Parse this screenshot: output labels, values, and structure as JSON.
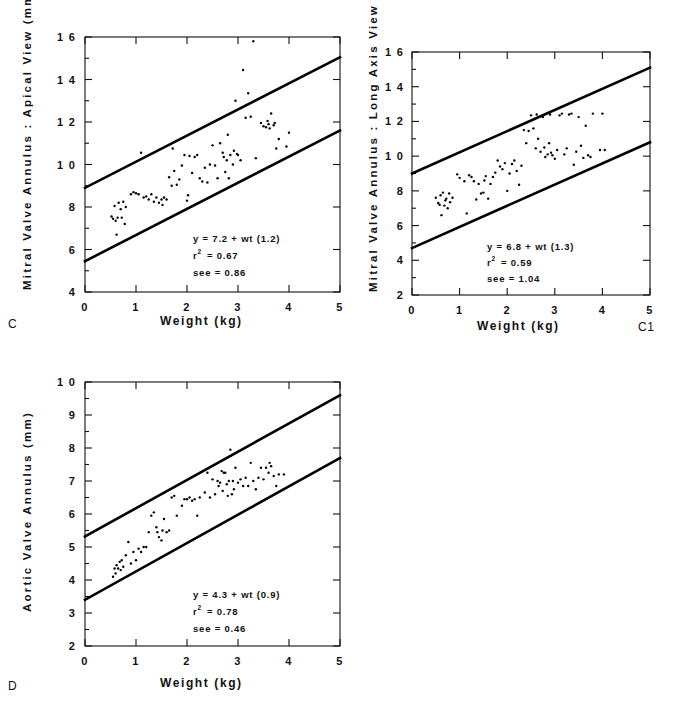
{
  "figure": {
    "background": "#ffffff",
    "ink_color": "#000000"
  },
  "chart_data": [
    {
      "id": "C",
      "panel_label": "C",
      "type": "scatter",
      "title": "",
      "xlabel": "Weight   (kg)",
      "ylabel": "Mitral  Valve  Annulus  :  Apical  View  (mm)",
      "xlim": [
        0,
        5
      ],
      "ylim": [
        4,
        16
      ],
      "xticks": [
        0,
        1,
        2,
        3,
        4,
        5
      ],
      "xtick_labels": [
        "0",
        "1",
        "2",
        "3",
        "4",
        "5"
      ],
      "yticks": [
        4,
        6,
        8,
        10,
        12,
        14,
        16
      ],
      "ytick_labels": [
        "4",
        "6",
        "8",
        "1 0",
        "1 2",
        "1 4",
        "1 6"
      ],
      "grid": false,
      "legend": "none",
      "annotations": {
        "equation": "y  =  7.2  +  wt  (1.2)",
        "r_label": "r",
        "r_exponent": "2",
        "r_value": "=  0.67",
        "see": "see  =  0.86"
      },
      "fit_lines": [
        {
          "name": "upper-limit",
          "x": [
            0,
            5
          ],
          "y": [
            8.9,
            15.05
          ]
        },
        {
          "name": "lower-limit",
          "x": [
            0,
            5
          ],
          "y": [
            5.45,
            11.6
          ]
        }
      ],
      "points": [
        [
          0.52,
          7.55
        ],
        [
          0.55,
          7.45
        ],
        [
          0.58,
          8.05
        ],
        [
          0.6,
          7.35
        ],
        [
          0.62,
          6.7
        ],
        [
          0.64,
          7.5
        ],
        [
          0.66,
          8.2
        ],
        [
          0.7,
          7.9
        ],
        [
          0.72,
          7.5
        ],
        [
          0.75,
          8.25
        ],
        [
          0.78,
          7.2
        ],
        [
          0.8,
          8.0
        ],
        [
          0.9,
          8.6
        ],
        [
          0.95,
          8.7
        ],
        [
          1.0,
          8.65
        ],
        [
          1.05,
          8.6
        ],
        [
          1.1,
          10.55
        ],
        [
          1.15,
          8.45
        ],
        [
          1.2,
          8.5
        ],
        [
          1.25,
          8.35
        ],
        [
          1.3,
          8.6
        ],
        [
          1.35,
          8.25
        ],
        [
          1.4,
          8.45
        ],
        [
          1.45,
          8.2
        ],
        [
          1.5,
          8.35
        ],
        [
          1.52,
          8.1
        ],
        [
          1.55,
          8.45
        ],
        [
          1.6,
          8.35
        ],
        [
          1.65,
          9.4
        ],
        [
          1.7,
          9.0
        ],
        [
          1.72,
          10.75
        ],
        [
          1.75,
          9.7
        ],
        [
          1.8,
          9.05
        ],
        [
          1.85,
          9.3
        ],
        [
          1.9,
          9.95
        ],
        [
          1.95,
          10.45
        ],
        [
          2.0,
          8.3
        ],
        [
          2.02,
          8.55
        ],
        [
          2.05,
          10.4
        ],
        [
          2.1,
          9.6
        ],
        [
          2.15,
          10.35
        ],
        [
          2.2,
          10.45
        ],
        [
          2.25,
          9.35
        ],
        [
          2.3,
          9.2
        ],
        [
          2.35,
          9.85
        ],
        [
          2.4,
          9.15
        ],
        [
          2.45,
          10.0
        ],
        [
          2.5,
          10.9
        ],
        [
          2.55,
          9.95
        ],
        [
          2.6,
          9.35
        ],
        [
          2.65,
          11.0
        ],
        [
          2.7,
          10.55
        ],
        [
          2.72,
          10.35
        ],
        [
          2.75,
          9.65
        ],
        [
          2.78,
          10.2
        ],
        [
          2.8,
          11.4
        ],
        [
          2.82,
          9.35
        ],
        [
          2.85,
          10.45
        ],
        [
          2.9,
          10.0
        ],
        [
          2.92,
          10.65
        ],
        [
          2.95,
          13.0
        ],
        [
          2.98,
          10.5
        ],
        [
          3.0,
          10.45
        ],
        [
          3.05,
          10.2
        ],
        [
          3.1,
          14.45
        ],
        [
          3.15,
          12.2
        ],
        [
          3.2,
          13.35
        ],
        [
          3.25,
          12.25
        ],
        [
          3.3,
          15.8
        ],
        [
          3.35,
          10.3
        ],
        [
          3.4,
          9.65
        ],
        [
          3.45,
          11.95
        ],
        [
          3.5,
          11.8
        ],
        [
          3.55,
          11.75
        ],
        [
          3.58,
          12.05
        ],
        [
          3.6,
          11.9
        ],
        [
          3.62,
          11.7
        ],
        [
          3.65,
          12.4
        ],
        [
          3.7,
          11.85
        ],
        [
          3.72,
          11.95
        ],
        [
          3.75,
          10.75
        ],
        [
          3.8,
          11.2
        ],
        [
          3.95,
          10.85
        ],
        [
          4.0,
          11.5
        ]
      ]
    },
    {
      "id": "C1",
      "panel_label": "C1",
      "type": "scatter",
      "title": "",
      "xlabel": "Weight   (kg)",
      "ylabel": "Mitral  Valve  Annulus  :  Long  Axis  View  (mm)",
      "xlim": [
        0,
        5
      ],
      "ylim": [
        2,
        16
      ],
      "xticks": [
        0,
        1,
        2,
        3,
        4,
        5
      ],
      "xtick_labels": [
        "0",
        "1",
        "2",
        "3",
        "4",
        "5"
      ],
      "yticks": [
        2,
        4,
        6,
        8,
        10,
        12,
        14,
        16
      ],
      "ytick_labels": [
        "2",
        "4",
        "6",
        "8",
        "1 0",
        "1 2",
        "1 4",
        "1 6"
      ],
      "grid": false,
      "legend": "none",
      "annotations": {
        "equation": "y  =  6.8  +  wt  (1.3)",
        "r_label": "r",
        "r_exponent": "2",
        "r_value": "=  0.59",
        "see": "see  =  1.04"
      },
      "fit_lines": [
        {
          "name": "upper-limit",
          "x": [
            0,
            5
          ],
          "y": [
            9.0,
            15.1
          ]
        },
        {
          "name": "lower-limit",
          "x": [
            0,
            5
          ],
          "y": [
            4.7,
            10.8
          ]
        }
      ],
      "points": [
        [
          0.5,
          7.6
        ],
        [
          0.55,
          7.3
        ],
        [
          0.58,
          7.2
        ],
        [
          0.6,
          7.75
        ],
        [
          0.62,
          6.6
        ],
        [
          0.65,
          7.9
        ],
        [
          0.68,
          7.15
        ],
        [
          0.7,
          7.45
        ],
        [
          0.72,
          7.55
        ],
        [
          0.75,
          7.0
        ],
        [
          0.78,
          7.85
        ],
        [
          0.8,
          7.35
        ],
        [
          0.85,
          7.6
        ],
        [
          0.95,
          8.95
        ],
        [
          1.0,
          8.75
        ],
        [
          1.1,
          8.55
        ],
        [
          1.15,
          6.7
        ],
        [
          1.2,
          8.9
        ],
        [
          1.25,
          8.8
        ],
        [
          1.3,
          8.55
        ],
        [
          1.35,
          7.5
        ],
        [
          1.4,
          8.4
        ],
        [
          1.45,
          7.85
        ],
        [
          1.5,
          7.9
        ],
        [
          1.52,
          8.6
        ],
        [
          1.55,
          8.85
        ],
        [
          1.6,
          7.55
        ],
        [
          1.65,
          8.4
        ],
        [
          1.7,
          8.8
        ],
        [
          1.75,
          9.05
        ],
        [
          1.8,
          9.75
        ],
        [
          1.85,
          9.4
        ],
        [
          1.9,
          9.25
        ],
        [
          1.95,
          9.6
        ],
        [
          2.0,
          8.0
        ],
        [
          2.05,
          9.0
        ],
        [
          2.1,
          9.55
        ],
        [
          2.15,
          9.75
        ],
        [
          2.2,
          9.15
        ],
        [
          2.25,
          8.35
        ],
        [
          2.3,
          9.45
        ],
        [
          2.35,
          11.5
        ],
        [
          2.4,
          10.75
        ],
        [
          2.45,
          11.45
        ],
        [
          2.5,
          12.35
        ],
        [
          2.55,
          11.6
        ],
        [
          2.6,
          10.45
        ],
        [
          2.62,
          12.4
        ],
        [
          2.65,
          11.0
        ],
        [
          2.7,
          10.25
        ],
        [
          2.75,
          12.25
        ],
        [
          2.78,
          10.5
        ],
        [
          2.8,
          9.95
        ],
        [
          2.85,
          10.1
        ],
        [
          2.88,
          10.75
        ],
        [
          2.9,
          12.4
        ],
        [
          2.92,
          10.2
        ],
        [
          2.95,
          10.05
        ],
        [
          3.0,
          9.85
        ],
        [
          3.05,
          10.35
        ],
        [
          3.1,
          12.35
        ],
        [
          3.15,
          12.45
        ],
        [
          3.2,
          10.1
        ],
        [
          3.25,
          10.45
        ],
        [
          3.3,
          12.4
        ],
        [
          3.35,
          12.45
        ],
        [
          3.4,
          9.5
        ],
        [
          3.45,
          10.25
        ],
        [
          3.5,
          12.25
        ],
        [
          3.55,
          10.6
        ],
        [
          3.6,
          9.9
        ],
        [
          3.65,
          11.75
        ],
        [
          3.7,
          10.05
        ],
        [
          3.75,
          9.95
        ],
        [
          3.8,
          12.45
        ],
        [
          3.95,
          10.35
        ],
        [
          4.0,
          12.45
        ],
        [
          4.05,
          10.35
        ]
      ]
    },
    {
      "id": "D",
      "panel_label": "D",
      "type": "scatter",
      "title": "",
      "xlabel": "Weight   (kg)",
      "ylabel": "Aortic  Valve  Annulus  (mm)",
      "xlim": [
        0,
        5
      ],
      "ylim": [
        2,
        10
      ],
      "xticks": [
        0,
        1,
        2,
        3,
        4,
        5
      ],
      "xtick_labels": [
        "0",
        "1",
        "2",
        "3",
        "4",
        "5"
      ],
      "yticks": [
        2,
        3,
        4,
        5,
        6,
        7,
        8,
        9,
        10
      ],
      "ytick_labels": [
        "2",
        "3",
        "4",
        "5",
        "6",
        "7",
        "8",
        "9",
        "1 0"
      ],
      "grid": false,
      "legend": "none",
      "annotations": {
        "equation": "y  =  4.3  +  wt  (0.9)",
        "r_label": "r",
        "r_exponent": "2",
        "r_value": "=  0.78",
        "see": "see  =  0.46"
      },
      "fit_lines": [
        {
          "name": "upper-limit",
          "x": [
            0,
            5
          ],
          "y": [
            5.32,
            9.6
          ]
        },
        {
          "name": "lower-limit",
          "x": [
            0,
            5
          ],
          "y": [
            3.4,
            7.7
          ]
        }
      ],
      "points": [
        [
          0.55,
          4.1
        ],
        [
          0.58,
          4.35
        ],
        [
          0.6,
          4.2
        ],
        [
          0.62,
          4.45
        ],
        [
          0.65,
          4.35
        ],
        [
          0.68,
          4.55
        ],
        [
          0.7,
          4.3
        ],
        [
          0.72,
          4.6
        ],
        [
          0.75,
          4.4
        ],
        [
          0.8,
          4.75
        ],
        [
          0.85,
          5.15
        ],
        [
          0.9,
          4.5
        ],
        [
          0.95,
          4.85
        ],
        [
          1.0,
          4.6
        ],
        [
          1.05,
          4.95
        ],
        [
          1.1,
          4.85
        ],
        [
          1.15,
          5.0
        ],
        [
          1.2,
          5.0
        ],
        [
          1.25,
          5.45
        ],
        [
          1.3,
          5.95
        ],
        [
          1.35,
          6.05
        ],
        [
          1.4,
          5.6
        ],
        [
          1.42,
          5.45
        ],
        [
          1.45,
          5.3
        ],
        [
          1.5,
          5.2
        ],
        [
          1.52,
          5.5
        ],
        [
          1.55,
          5.85
        ],
        [
          1.6,
          5.45
        ],
        [
          1.65,
          5.5
        ],
        [
          1.7,
          6.5
        ],
        [
          1.75,
          6.55
        ],
        [
          1.8,
          5.95
        ],
        [
          1.9,
          6.25
        ],
        [
          1.95,
          6.45
        ],
        [
          2.0,
          6.45
        ],
        [
          2.05,
          6.5
        ],
        [
          2.1,
          6.4
        ],
        [
          2.15,
          6.45
        ],
        [
          2.2,
          5.95
        ],
        [
          2.25,
          6.5
        ],
        [
          2.35,
          6.65
        ],
        [
          2.4,
          7.25
        ],
        [
          2.45,
          6.5
        ],
        [
          2.5,
          7.05
        ],
        [
          2.55,
          6.6
        ],
        [
          2.6,
          7.0
        ],
        [
          2.62,
          6.85
        ],
        [
          2.65,
          6.95
        ],
        [
          2.68,
          7.3
        ],
        [
          2.7,
          6.7
        ],
        [
          2.72,
          7.25
        ],
        [
          2.75,
          7.25
        ],
        [
          2.78,
          6.9
        ],
        [
          2.8,
          6.55
        ],
        [
          2.82,
          7.0
        ],
        [
          2.85,
          7.95
        ],
        [
          2.88,
          6.6
        ],
        [
          2.9,
          7.0
        ],
        [
          2.92,
          6.75
        ],
        [
          2.95,
          7.4
        ],
        [
          3.0,
          6.95
        ],
        [
          3.05,
          7.05
        ],
        [
          3.1,
          6.85
        ],
        [
          3.15,
          7.1
        ],
        [
          3.2,
          6.85
        ],
        [
          3.25,
          7.55
        ],
        [
          3.3,
          7.0
        ],
        [
          3.35,
          6.75
        ],
        [
          3.4,
          7.1
        ],
        [
          3.45,
          7.4
        ],
        [
          3.5,
          7.05
        ],
        [
          3.55,
          7.4
        ],
        [
          3.6,
          7.25
        ],
        [
          3.62,
          7.55
        ],
        [
          3.65,
          7.45
        ],
        [
          3.7,
          7.15
        ],
        [
          3.75,
          6.85
        ],
        [
          3.8,
          7.2
        ],
        [
          3.9,
          7.2
        ]
      ]
    }
  ]
}
